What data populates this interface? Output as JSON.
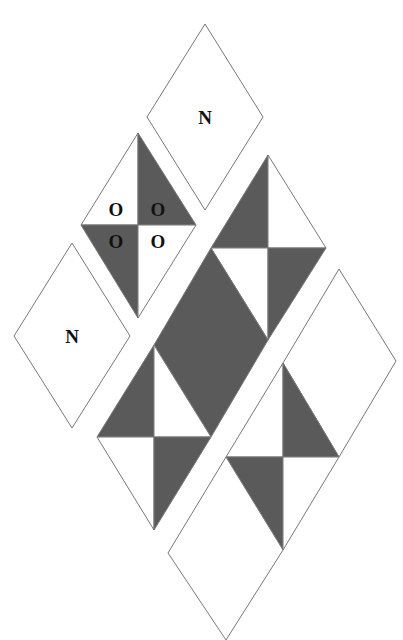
{
  "colors": {
    "dark": "#5a5a5a",
    "light": "#ffffff",
    "stroke": "#777777",
    "text": "#111111"
  },
  "labels": {
    "top_piece": "N",
    "left_piece": "N",
    "o_piece": [
      "O",
      "O",
      "O",
      "O"
    ]
  }
}
